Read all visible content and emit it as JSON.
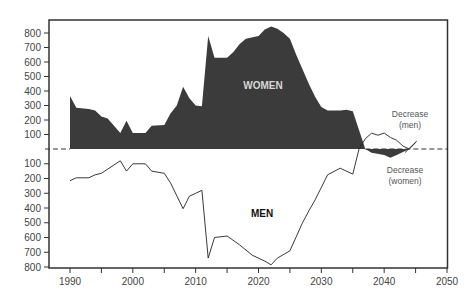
{
  "chart_data": {
    "type": "area",
    "title": "",
    "xlabel": "",
    "ylabel": "",
    "xlim": [
      1990,
      2050
    ],
    "ylim_upper": [
      0,
      800
    ],
    "ylim_lower": [
      0,
      800
    ],
    "grid": false,
    "x_ticks": [
      1990,
      2000,
      2010,
      2020,
      2030,
      2040,
      2050
    ],
    "x_minor_ticks": [
      1995,
      2005,
      2015,
      2025,
      2035,
      2045
    ],
    "y_ticks_upper": [
      100,
      200,
      300,
      400,
      500,
      600,
      700,
      800
    ],
    "y_ticks_lower": [
      100,
      200,
      300,
      400,
      500,
      600,
      700,
      800
    ],
    "series": [
      {
        "name": "WOMEN",
        "style": "filled area above baseline",
        "color": "#3b3b3b",
        "points": [
          [
            1990,
            365
          ],
          [
            1991,
            285
          ],
          [
            1993,
            275
          ],
          [
            1994,
            265
          ],
          [
            1995,
            225
          ],
          [
            1996,
            210
          ],
          [
            1998,
            110
          ],
          [
            1999,
            195
          ],
          [
            2000,
            110
          ],
          [
            2002,
            110
          ],
          [
            2003,
            160
          ],
          [
            2005,
            165
          ],
          [
            2006,
            245
          ],
          [
            2007,
            300
          ],
          [
            2008,
            430
          ],
          [
            2009,
            350
          ],
          [
            2010,
            300
          ],
          [
            2011,
            295
          ],
          [
            2012,
            780
          ],
          [
            2013,
            630
          ],
          [
            2015,
            630
          ],
          [
            2016,
            670
          ],
          [
            2017,
            725
          ],
          [
            2018,
            760
          ],
          [
            2020,
            780
          ],
          [
            2021,
            825
          ],
          [
            2022,
            845
          ],
          [
            2023,
            830
          ],
          [
            2024,
            800
          ],
          [
            2025,
            760
          ],
          [
            2026,
            650
          ],
          [
            2027,
            550
          ],
          [
            2028,
            450
          ],
          [
            2029,
            360
          ],
          [
            2030,
            290
          ],
          [
            2031,
            265
          ],
          [
            2033,
            265
          ],
          [
            2034,
            270
          ],
          [
            2035,
            260
          ],
          [
            2037,
            0
          ]
        ]
      },
      {
        "name": "MEN",
        "style": "line below baseline (values plotted downward)",
        "color": "#222222",
        "points": [
          [
            1990,
            215
          ],
          [
            1991,
            195
          ],
          [
            1993,
            195
          ],
          [
            1994,
            175
          ],
          [
            1995,
            165
          ],
          [
            1998,
            80
          ],
          [
            1999,
            150
          ],
          [
            2000,
            100
          ],
          [
            2002,
            100
          ],
          [
            2003,
            150
          ],
          [
            2005,
            165
          ],
          [
            2006,
            230
          ],
          [
            2008,
            405
          ],
          [
            2009,
            320
          ],
          [
            2010,
            300
          ],
          [
            2011,
            280
          ],
          [
            2012,
            740
          ],
          [
            2013,
            600
          ],
          [
            2015,
            590
          ],
          [
            2017,
            650
          ],
          [
            2019,
            720
          ],
          [
            2021,
            760
          ],
          [
            2022,
            785
          ],
          [
            2023,
            740
          ],
          [
            2025,
            690
          ],
          [
            2027,
            500
          ],
          [
            2028,
            420
          ],
          [
            2029,
            345
          ],
          [
            2031,
            175
          ],
          [
            2033,
            130
          ],
          [
            2035,
            170
          ],
          [
            2036,
            0
          ]
        ]
      },
      {
        "name": "Decrease (men)",
        "style": "line above baseline",
        "color": "#222222",
        "points": [
          [
            2036,
            0
          ],
          [
            2037,
            70
          ],
          [
            2038,
            110
          ],
          [
            2039,
            95
          ],
          [
            2040,
            110
          ],
          [
            2041,
            80
          ],
          [
            2042,
            60
          ],
          [
            2043,
            20
          ],
          [
            2044,
            0
          ],
          [
            2045,
            45
          ]
        ]
      },
      {
        "name": "Decrease (women)",
        "style": "filled area below baseline",
        "color": "#3b3b3b",
        "points": [
          [
            2037,
            0
          ],
          [
            2038,
            25
          ],
          [
            2040,
            40
          ],
          [
            2041,
            60
          ],
          [
            2042,
            40
          ],
          [
            2043,
            20
          ],
          [
            2044,
            0
          ]
        ]
      }
    ],
    "annotations": [
      {
        "text": "WOMEN",
        "x": 2023,
        "y": 440,
        "side": "upper"
      },
      {
        "text": "MEN",
        "x": 2023,
        "y": 440,
        "side": "lower"
      },
      {
        "text": "Decrease (men)",
        "x": 2046,
        "y": 180,
        "side": "upper"
      },
      {
        "text": "Decrease (women)",
        "x": 2046,
        "y": 180,
        "side": "lower"
      }
    ],
    "baseline": "dashed horizontal line at 0"
  },
  "labels": {
    "women": "WOMEN",
    "men": "MEN",
    "decrease_men_line1": "Decrease",
    "decrease_men_line2": "(men)",
    "decrease_women_line1": "Decrease",
    "decrease_women_line2": "(women)"
  },
  "colors": {
    "fill": "#3b3b3b",
    "line": "#222222",
    "axis": "#333333",
    "women_label": "#d8d8d8"
  }
}
